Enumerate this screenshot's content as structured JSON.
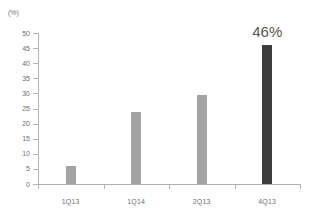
{
  "chart_data": {
    "type": "bar",
    "title": "",
    "subtitle": "",
    "xlabel": "",
    "ylabel": "(%)",
    "unit_label": "(%)",
    "categories": [
      "1Q13",
      "1Q14",
      "2Q13",
      "4Q13"
    ],
    "values": [
      6,
      24,
      29.5,
      46
    ],
    "ylim": [
      0,
      50
    ],
    "yticks": [
      0,
      5,
      10,
      15,
      20,
      25,
      30,
      35,
      40,
      45,
      50
    ],
    "ytick_labels": [
      "0",
      "5",
      "10",
      "15",
      "20",
      "25",
      "30",
      "35",
      "40",
      "45",
      "50"
    ],
    "grid": false,
    "legend": null,
    "annotations": [
      {
        "text": "46%",
        "category": "4Q13",
        "value": 46
      }
    ],
    "bar_colors": [
      "#a3a3a3",
      "#a3a3a3",
      "#a3a3a3",
      "#3c3c3c"
    ],
    "colors": {
      "bar_gray": "#a3a3a3",
      "bar_dark": "#3c3c3c",
      "axis": "#b0b0b0",
      "tick_text": "#6e6e6e",
      "label_text": "#565656",
      "background": "#ffffff"
    }
  }
}
